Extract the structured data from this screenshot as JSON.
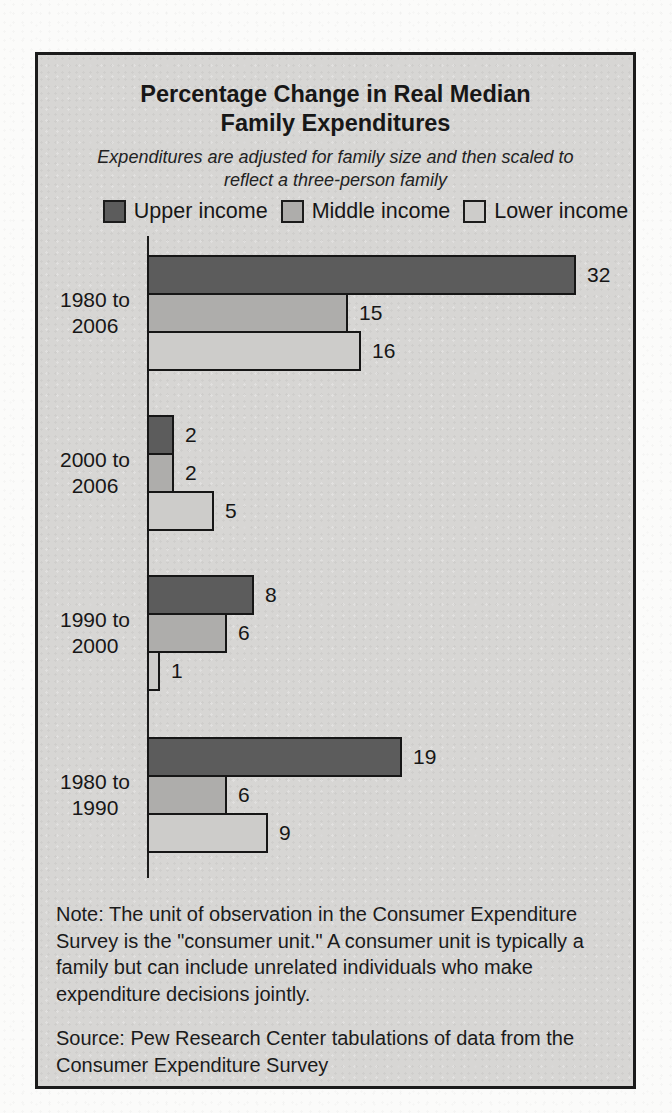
{
  "chart_data": {
    "type": "bar",
    "orientation": "horizontal",
    "title": "Percentage Change in Real Median Family Expenditures",
    "subtitle": "Expenditures are adjusted for family size and then scaled to reflect a three-person family",
    "categories": [
      "1980 to 2006",
      "2000 to 2006",
      "1990 to 2000",
      "1980 to 1990"
    ],
    "series": [
      {
        "name": "Upper income",
        "color": "#5c5c5c",
        "values": [
          32,
          2,
          8,
          19
        ]
      },
      {
        "name": "Middle income",
        "color": "#aeadab",
        "values": [
          15,
          2,
          6,
          6
        ]
      },
      {
        "name": "Lower income",
        "color": "#cdccca",
        "values": [
          16,
          5,
          1,
          9
        ]
      }
    ],
    "data_labels": true,
    "value_axis_shown": false,
    "legend_position": "top",
    "ink_color": "#1b1b1b",
    "panel_background": "#d7d6d4",
    "note": "Note: The unit of observation in the Consumer Expenditure Survey is the \"consumer unit.\" A consumer unit is typically a family but can include unrelated individuals who make expenditure decisions jointly.",
    "source": "Source: Pew Research Center tabulations of data from the Consumer Expenditure Survey"
  }
}
